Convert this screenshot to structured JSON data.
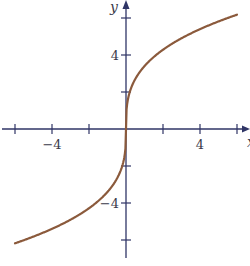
{
  "chart_data": {
    "type": "line",
    "title": "",
    "xlabel": "x",
    "ylabel": "y",
    "xlim": [
      -6.5,
      6.5
    ],
    "ylim": [
      -6.7,
      6.7
    ],
    "grid": false,
    "legend": null,
    "x_ticks": [
      -6,
      -4,
      -2,
      2,
      4,
      6
    ],
    "x_tick_labels": {
      "-4": "−4",
      "4": "4"
    },
    "y_ticks": [
      -6,
      -4,
      -2,
      2,
      4,
      6
    ],
    "y_tick_labels": {
      "4": "4",
      "-4": "−4"
    },
    "series": [
      {
        "name": "curve",
        "color": "#8b5a3c",
        "description": "odd, increasing S-shaped curve through origin, approx y = 3.4 * cbrt(x)",
        "x": [
          -6,
          -5,
          -4,
          -3,
          -2,
          -1,
          -0.5,
          -0.1,
          0,
          0.1,
          0.5,
          1,
          2,
          3,
          4,
          5,
          6
        ],
        "y": [
          -6.2,
          -5.8,
          -5.4,
          -4.9,
          -4.3,
          -3.4,
          -2.7,
          -1.6,
          0,
          1.6,
          2.7,
          3.4,
          4.3,
          4.9,
          5.4,
          5.8,
          6.2
        ]
      }
    ],
    "colors": {
      "axis": "#2f3566",
      "curve": "#8b5a3c",
      "text": "#3a3a4a"
    }
  }
}
